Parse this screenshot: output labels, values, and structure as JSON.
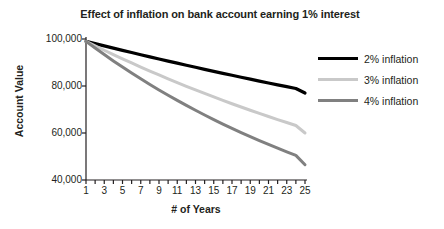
{
  "chart_data": {
    "type": "line",
    "title": "Effect of inflation on bank account earning 1% interest",
    "xlabel": "# of Years",
    "ylabel": "Account Value",
    "xlim": [
      1,
      25
    ],
    "ylim": [
      40000,
      100000
    ],
    "yticks": [
      "40,000",
      "60,000",
      "80,000",
      "100,000"
    ],
    "ytick_values": [
      40000,
      60000,
      80000,
      100000
    ],
    "xticks": [
      "1",
      "3",
      "5",
      "7",
      "9",
      "11",
      "13",
      "15",
      "17",
      "19",
      "21",
      "23",
      "25"
    ],
    "xtick_values": [
      1,
      3,
      5,
      7,
      9,
      11,
      13,
      15,
      17,
      19,
      21,
      23,
      25
    ],
    "grid": false,
    "legend_position": "right",
    "x": [
      1,
      2,
      3,
      4,
      5,
      6,
      7,
      8,
      9,
      10,
      11,
      12,
      13,
      14,
      15,
      16,
      17,
      18,
      19,
      20,
      21,
      22,
      23,
      24,
      25
    ],
    "series": [
      {
        "name": "2% inflation",
        "color": "#000000",
        "width": 3.2,
        "values": [
          99000,
          98030,
          97069,
          96117,
          95175,
          94242,
          93318,
          92403,
          91497,
          90600,
          89712,
          88832,
          87961,
          87099,
          86245,
          85399,
          84562,
          83733,
          82912,
          82099,
          81294,
          80497,
          79708,
          78926,
          77000
        ]
      },
      {
        "name": "3% inflation",
        "color": "#c9c9c9",
        "width": 3.0,
        "values": [
          99000,
          97087,
          95211,
          93371,
          91567,
          89798,
          88063,
          86361,
          84692,
          83055,
          81450,
          79876,
          78333,
          76819,
          75335,
          73879,
          72451,
          71051,
          69678,
          68332,
          67011,
          65717,
          64447,
          63202,
          60000
        ]
      },
      {
        "name": "4% inflation",
        "color": "#808080",
        "width": 3.0,
        "values": [
          99000,
          96144,
          93370,
          90676,
          88060,
          85520,
          83053,
          80657,
          78330,
          76071,
          73876,
          71745,
          69675,
          67665,
          65713,
          63817,
          61976,
          60188,
          58452,
          56765,
          55127,
          53537,
          51992,
          50492,
          46500
        ]
      }
    ]
  }
}
